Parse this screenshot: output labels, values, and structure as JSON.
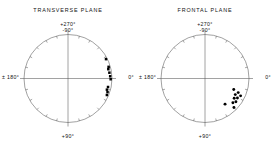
{
  "figure": {
    "background": "#ffffff",
    "line_color": "#555555",
    "marker_color": "#000000",
    "width": 273,
    "height": 150
  },
  "panels": [
    {
      "id": "transverse",
      "title": "TRANSVERSE PLANE",
      "axis_labels": {
        "top_primary": "+270°",
        "top_secondary": "-90°",
        "left": "± 180°",
        "right": "0°",
        "bottom": "+90°"
      },
      "marker_shape": "square"
    },
    {
      "id": "frontal",
      "title": "FRONTAL PLANE",
      "axis_labels": {
        "top_primary": "+270°",
        "top_secondary": "-90°",
        "left": "± 180°",
        "right": "0°",
        "bottom": "+90°"
      },
      "marker_shape": "circle"
    }
  ],
  "chart_data": [
    {
      "type": "scatter",
      "coordinate_system": "polar",
      "title": "TRANSVERSE PLANE",
      "marker": "square",
      "angle_unit": "degrees",
      "angle_convention": "0° at right, positive angles clockwise (downward)",
      "radius_range": [
        0,
        1
      ],
      "grid": false,
      "axis_tick_interval_deg": 15,
      "axis_tick_labels": [
        "+270° / -90°",
        "0°",
        "+90°",
        "± 180°"
      ],
      "points": [
        {
          "angle_deg": -27,
          "r": 0.97
        },
        {
          "angle_deg": -16,
          "r": 0.96
        },
        {
          "angle_deg": -13,
          "r": 0.94
        },
        {
          "angle_deg": -8,
          "r": 0.95
        },
        {
          "angle_deg": -3,
          "r": 0.96
        },
        {
          "angle_deg": 1,
          "r": 0.97
        },
        {
          "angle_deg": 12,
          "r": 0.93
        },
        {
          "angle_deg": 16,
          "r": 0.92
        },
        {
          "angle_deg": 19,
          "r": 0.95
        },
        {
          "angle_deg": 23,
          "r": 0.96
        }
      ]
    },
    {
      "type": "scatter",
      "coordinate_system": "polar",
      "title": "FRONTAL PLANE",
      "marker": "circle",
      "angle_unit": "degrees",
      "angle_convention": "0° at right, positive angles clockwise (downward)",
      "radius_range": [
        0,
        1
      ],
      "grid": false,
      "axis_tick_interval_deg": 15,
      "axis_tick_labels": [
        "+270° / -90°",
        "0°",
        "+90°",
        "± 180°"
      ],
      "points": [
        {
          "angle_deg": 21,
          "r": 0.7
        },
        {
          "angle_deg": 23,
          "r": 0.82
        },
        {
          "angle_deg": 26,
          "r": 0.9
        },
        {
          "angle_deg": 28,
          "r": 0.78
        },
        {
          "angle_deg": 31,
          "r": 0.86
        },
        {
          "angle_deg": 34,
          "r": 0.8
        },
        {
          "angle_deg": 37,
          "r": 0.88
        },
        {
          "angle_deg": 41,
          "r": 0.84
        },
        {
          "angle_deg": 45,
          "r": 0.93
        },
        {
          "angle_deg": 52,
          "r": 0.74
        }
      ]
    }
  ]
}
